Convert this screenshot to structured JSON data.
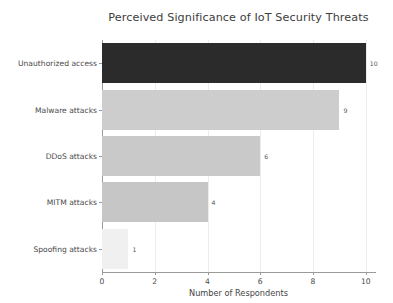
{
  "chart_data": {
    "type": "bar",
    "orientation": "horizontal",
    "title": "Perceived Significance of IoT Security Threats",
    "xlabel": "Number of Respondents",
    "ylabel": "",
    "categories": [
      "Unauthorized access",
      "Malware attacks",
      "DDoS attacks",
      "MITM attacks",
      "Spoofing attacks"
    ],
    "values": [
      10,
      9,
      6,
      4,
      1
    ],
    "value_labels": [
      "10",
      "9",
      "6",
      "4",
      "1"
    ],
    "bar_colors": [
      "#2b2b2b",
      "#cdcdcd",
      "#c9c9c9",
      "#c6c6c6",
      "#f0f0f0"
    ],
    "xlim": [
      0,
      10.35
    ],
    "xticks": [
      0,
      2,
      4,
      6,
      8,
      10
    ],
    "xtick_labels": [
      "0",
      "2",
      "4",
      "6",
      "8",
      "10"
    ],
    "grid": "vertical",
    "legend": "none",
    "background": "#ffffff"
  }
}
